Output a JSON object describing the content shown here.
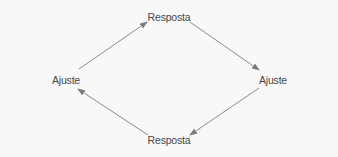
{
  "diagram": {
    "type": "cycle",
    "colors": {
      "background": "#f8f8f8",
      "text": "#474747",
      "arrow": "#8a8a8a"
    },
    "nodes": [
      {
        "id": "top",
        "label": "Resposta"
      },
      {
        "id": "right",
        "label": "Ajuste"
      },
      {
        "id": "bottom",
        "label": "Resposta"
      },
      {
        "id": "left",
        "label": "Ajuste"
      }
    ],
    "edges": [
      {
        "from": "left",
        "to": "top"
      },
      {
        "from": "top",
        "to": "right"
      },
      {
        "from": "right",
        "to": "bottom"
      },
      {
        "from": "bottom",
        "to": "left"
      }
    ]
  }
}
